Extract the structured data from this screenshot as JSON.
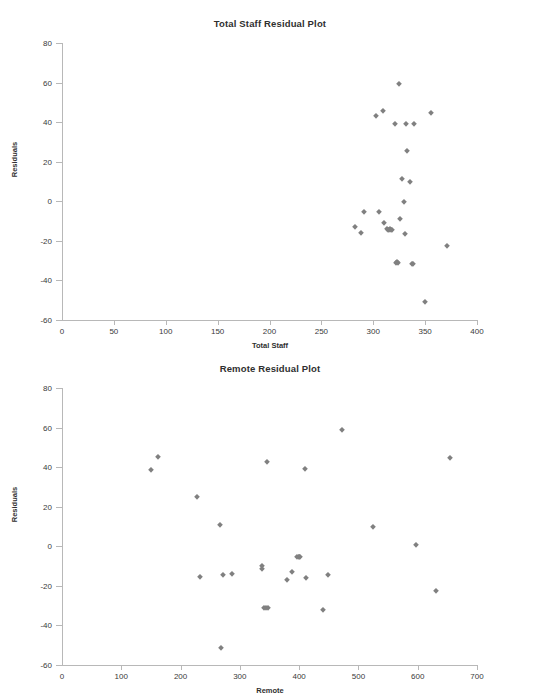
{
  "document": {
    "background_color": "#ffffff",
    "marker_color": "#808080",
    "axis_color": "#b8b8b8",
    "text_color": "#3a3a3a"
  },
  "chart_data": [
    {
      "type": "scatter",
      "title": "Total Staff Residual Plot",
      "xlabel": "Total Staff",
      "ylabel": "Residuals",
      "xlim": [
        0,
        400
      ],
      "ylim": [
        -60,
        80
      ],
      "xticks": [
        0,
        50,
        100,
        150,
        200,
        250,
        300,
        350,
        400
      ],
      "yticks": [
        -60,
        -40,
        -20,
        0,
        20,
        40,
        60,
        80
      ],
      "grid": false,
      "legend": false,
      "series": [
        {
          "name": "Total Staff residuals",
          "x": [
            282,
            288,
            291,
            303,
            306,
            309,
            310,
            313,
            314,
            315,
            316,
            317,
            318,
            321,
            322,
            323,
            324,
            325,
            326,
            328,
            330,
            331,
            332,
            333,
            335,
            337,
            338,
            339,
            350,
            356,
            371
          ],
          "y": [
            -13,
            -16,
            -5.5,
            43,
            -5.5,
            45.5,
            -11,
            -14,
            -14.5,
            -14.5,
            -14,
            -14.5,
            -14.5,
            39,
            -31,
            -30.5,
            -31,
            59.5,
            -9,
            11.5,
            -0.5,
            -16.5,
            39,
            25.5,
            9.5,
            -31.5,
            -31.5,
            39,
            -51,
            44.5,
            -22.5
          ]
        }
      ]
    },
    {
      "type": "scatter",
      "title": "Remote Residual Plot",
      "xlabel": "Remote",
      "ylabel": "Residuals",
      "xlim": [
        0,
        700
      ],
      "ylim": [
        -60,
        80
      ],
      "xticks": [
        0,
        100,
        200,
        300,
        400,
        500,
        600,
        700
      ],
      "yticks": [
        -60,
        -40,
        -20,
        0,
        20,
        40,
        60,
        80
      ],
      "grid": false,
      "legend": false,
      "series": [
        {
          "name": "Remote residuals",
          "x": [
            150,
            162,
            228,
            232,
            267,
            269,
            271,
            287,
            337,
            338,
            340,
            344,
            346,
            348,
            380,
            388,
            396,
            399,
            400,
            401,
            410,
            411,
            440,
            448,
            472,
            524,
            597,
            630,
            654
          ],
          "y": [
            38.5,
            45,
            25,
            -15.5,
            11,
            -51.5,
            -14.5,
            -14,
            -10,
            -11.5,
            -31,
            -31,
            42.5,
            -31,
            -17,
            -13,
            -5.5,
            -5.5,
            -5.5,
            -5.5,
            39,
            -16,
            -32,
            -14.5,
            59,
            9.5,
            0.5,
            -22.5,
            44.5
          ]
        }
      ]
    }
  ]
}
